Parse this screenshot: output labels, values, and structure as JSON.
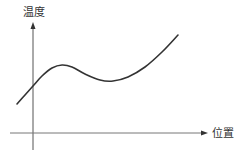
{
  "diagram": {
    "y_axis": {
      "label": "温度"
    },
    "x_axis": {
      "label": "位置"
    },
    "colors": {
      "axis": "#555555",
      "curve": "#333333",
      "text": "#333333",
      "background": "#ffffff"
    }
  },
  "chart_data": {
    "type": "line",
    "title": "",
    "xlabel": "位置",
    "ylabel": "温度",
    "grid": false,
    "ticks": "none",
    "series": [
      {
        "name": "温度曲线",
        "points_px": [
          [
            17,
            104
          ],
          [
            25,
            95
          ],
          [
            33,
            86
          ],
          [
            42,
            76
          ],
          [
            52,
            68
          ],
          [
            62,
            65
          ],
          [
            72,
            67
          ],
          [
            85,
            74
          ],
          [
            100,
            80
          ],
          [
            113,
            81
          ],
          [
            128,
            77
          ],
          [
            145,
            67
          ],
          [
            162,
            52
          ],
          [
            178,
            35
          ]
        ]
      }
    ],
    "features": {
      "local_max_px": [
        62,
        65
      ],
      "local_min_px": [
        113,
        81
      ]
    }
  }
}
